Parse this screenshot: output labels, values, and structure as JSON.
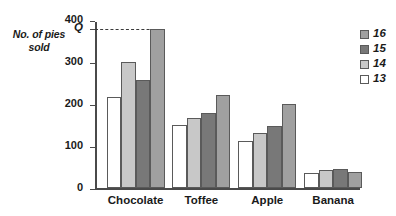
{
  "chart_data": {
    "type": "bar",
    "title": "",
    "xlabel": "",
    "ylabel": "No. of pies sold",
    "categories": [
      "Chocolate",
      "Toffee",
      "Apple",
      "Banana"
    ],
    "series": [
      {
        "name": "13",
        "color": "#ffffff",
        "values": [
          218,
          150,
          114,
          37
        ]
      },
      {
        "name": "14",
        "color": "#c8c8c8",
        "values": [
          302,
          168,
          133,
          43
        ]
      },
      {
        "name": "15",
        "color": "#787878",
        "values": [
          259,
          180,
          148,
          46
        ]
      },
      {
        "name": "16",
        "color": "#a0a0a0",
        "values": [
          380,
          222,
          200,
          38
        ]
      }
    ],
    "yticks": [
      0,
      100,
      200,
      300,
      400
    ],
    "ytick_labels": [
      "0",
      "100",
      "200",
      "300",
      "400"
    ],
    "ylim": [
      0,
      400
    ],
    "grid": false,
    "legend_position": "right",
    "annotations": [
      {
        "name": "q-line",
        "label": "Q",
        "value": 380,
        "style": "dashed",
        "from": "y-axis",
        "to": "Chocolate-16-bar"
      }
    ]
  },
  "axis": {
    "y_caption": "No. of pies sold",
    "q_label": "Q"
  },
  "legend": {
    "items": [
      {
        "label": "16",
        "color": "#a0a0a0"
      },
      {
        "label": "15",
        "color": "#787878"
      },
      {
        "label": "14",
        "color": "#c8c8c8"
      },
      {
        "label": "13",
        "color": "#ffffff"
      }
    ]
  }
}
